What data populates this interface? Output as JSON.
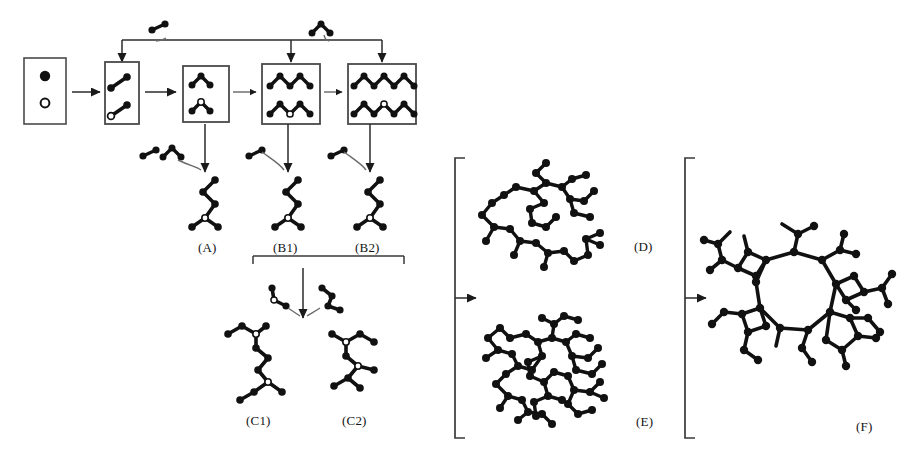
{
  "figure": {
    "domain": "diagram",
    "kind": "reaction / cluster-growth schematic",
    "background_color": "#ffffff",
    "ink_color": "#111111",
    "line_color": "#333333",
    "atom_fill_dark": "#111111",
    "atom_fill_open": "#ffffff",
    "width": 915,
    "height": 462
  },
  "legend_box": {
    "name": "species-key",
    "items": [
      {
        "id": "dark-atom",
        "style": "filled",
        "cx": 45,
        "cy": 76,
        "r": 5.2
      },
      {
        "id": "open-atom",
        "style": "open",
        "cx": 45,
        "cy": 103,
        "r": 4.2
      }
    ],
    "rect": {
      "x": 24,
      "y": 58,
      "w": 42,
      "h": 66
    }
  },
  "stage_boxes": [
    {
      "id": "box-dimers",
      "rect": {
        "x": 105,
        "y": 62,
        "w": 34,
        "h": 62
      }
    },
    {
      "id": "box-trimers",
      "rect": {
        "x": 183,
        "y": 66,
        "w": 46,
        "h": 56
      }
    },
    {
      "id": "box-pentamers",
      "rect": {
        "x": 262,
        "y": 64,
        "w": 58,
        "h": 60
      }
    },
    {
      "id": "box-heptamers",
      "rect": {
        "x": 348,
        "y": 64,
        "w": 68,
        "h": 60
      }
    }
  ],
  "labels": [
    {
      "id": "label-A",
      "text": "(A)",
      "x": 198,
      "y": 240
    },
    {
      "id": "label-B1",
      "text": "(B1)",
      "x": 276,
      "y": 240
    },
    {
      "id": "label-B2",
      "text": "(B2)",
      "x": 358,
      "y": 240
    },
    {
      "id": "label-C1",
      "text": "(C1)",
      "x": 249,
      "y": 413
    },
    {
      "id": "label-C2",
      "text": "(C2)",
      "x": 345,
      "y": 413
    },
    {
      "id": "label-D",
      "text": "(D)",
      "x": 634,
      "y": 239
    },
    {
      "id": "label-E",
      "text": "(E)",
      "x": 636,
      "y": 414
    },
    {
      "id": "label-F",
      "text": "(F)",
      "x": 858,
      "y": 419
    }
  ],
  "feed_species": [
    {
      "id": "feed-dimer-top",
      "kind": "dimer",
      "x": 160,
      "y": 33,
      "note": "adds to chain growth line"
    },
    {
      "id": "feed-trimer-top",
      "kind": "trimer",
      "x": 322,
      "y": 30,
      "note": "adds to chain growth line"
    },
    {
      "id": "feed-trimer-A",
      "kind": "trimer",
      "x": 165,
      "y": 152
    },
    {
      "id": "feed-dimer-A",
      "kind": "dimer",
      "x": 146,
      "y": 155
    },
    {
      "id": "feed-dimer-B1",
      "kind": "dimer",
      "x": 252,
      "y": 155
    },
    {
      "id": "feed-dimer-B2",
      "kind": "dimer",
      "x": 334,
      "y": 155
    },
    {
      "id": "feed-dimer-C-left",
      "kind": "dimer",
      "x": 277,
      "y": 297
    },
    {
      "id": "feed-dimer-C-right",
      "kind": "dimer",
      "x": 326,
      "y": 297
    }
  ],
  "brackets": [
    {
      "id": "bracket-B-group",
      "orientation": "horizontal-under",
      "x1": 253,
      "x2": 404,
      "y": 256,
      "tick": 8
    },
    {
      "id": "bracket-DE",
      "orientation": "vertical-left",
      "x": 455,
      "y1": 158,
      "y2": 438,
      "tick": 10
    },
    {
      "id": "bracket-F",
      "orientation": "vertical-left",
      "x": 685,
      "y1": 158,
      "y2": 438,
      "tick": 10
    }
  ],
  "arrows": [
    {
      "id": "arrow-key-to-dimers",
      "from": "legend-box",
      "to": "box-dimers"
    },
    {
      "id": "arrow-dimers-to-trimers",
      "from": "box-dimers",
      "to": "box-trimers"
    },
    {
      "id": "arrow-trimers-to-penta",
      "from": "box-trimers",
      "to": "box-pentamers"
    },
    {
      "id": "arrow-penta-to-hepta",
      "from": "box-pentamers",
      "to": "box-heptamers"
    },
    {
      "id": "arrow-down-to-A",
      "from": "box-trimers",
      "to": "structure-A"
    },
    {
      "id": "arrow-down-to-B1",
      "from": "box-pentamers",
      "to": "structure-B1"
    },
    {
      "id": "arrow-down-to-B2",
      "from": "box-heptamers",
      "to": "structure-B2"
    },
    {
      "id": "arrow-B-to-C",
      "from": "bracket-B-group",
      "to": "structures-C"
    },
    {
      "id": "arrow-bracket-DE-out",
      "from": "bracket-DE",
      "to": "cluster-region-DE"
    },
    {
      "id": "arrow-bracket-F-out",
      "from": "bracket-F",
      "to": "cluster-F"
    },
    {
      "id": "arrow-feed-dimer-line",
      "from": "feed-dimer-top",
      "to": "growth-rail"
    },
    {
      "id": "arrow-feed-trimer-line",
      "from": "feed-trimer-top",
      "to": "growth-rail"
    }
  ],
  "structures": {
    "A": {
      "id": "structure-A",
      "desc": "branched zig-zag oligomer",
      "cx": 205,
      "cy": 195
    },
    "B1": {
      "id": "structure-B1",
      "desc": "branched zig-zag oligomer",
      "cx": 288,
      "cy": 195
    },
    "B2": {
      "id": "structure-B2",
      "desc": "branched zig-zag oligomer",
      "cx": 370,
      "cy": 195
    },
    "C1": {
      "id": "structure-C1",
      "desc": "larger branched oligomer",
      "cx": 262,
      "cy": 360
    },
    "C2": {
      "id": "structure-C2",
      "desc": "larger branched oligomer",
      "cx": 358,
      "cy": 360
    },
    "D": {
      "id": "cluster-D",
      "desc": "open branched network",
      "cx": 560,
      "cy": 215
    },
    "E": {
      "id": "cluster-E",
      "desc": "dense branched network",
      "cx": 562,
      "cy": 368
    },
    "F": {
      "id": "cluster-F",
      "desc": "ring-containing dense network",
      "cx": 800,
      "cy": 300
    }
  },
  "growth_rail": {
    "id": "growth-rail",
    "y": 40,
    "x1": 122,
    "x2": 382
  }
}
